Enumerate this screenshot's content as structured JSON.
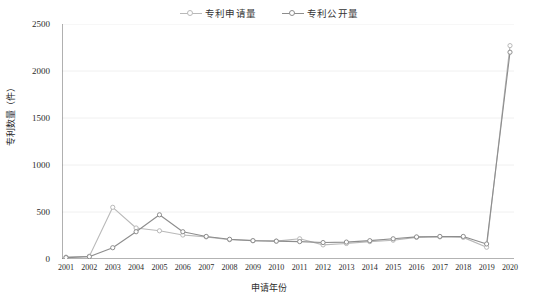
{
  "chart_data": {
    "type": "line",
    "title": "",
    "xlabel": "申请年份",
    "ylabel": "专利数量（件）",
    "ylim": [
      0,
      2500
    ],
    "yticks": [
      0,
      500,
      1000,
      1500,
      2000,
      2500
    ],
    "grid": true,
    "legend_position": "top-center",
    "categories": [
      "2001",
      "2002",
      "2003",
      "2004",
      "2005",
      "2006",
      "2007",
      "2008",
      "2009",
      "2010",
      "2011",
      "2012",
      "2013",
      "2014",
      "2015",
      "2016",
      "2017",
      "2018",
      "2019",
      "2020"
    ],
    "series": [
      {
        "name": "专利申请量",
        "color": "#b9b9b9",
        "marker": "circle-open",
        "values": [
          20,
          30,
          550,
          330,
          300,
          255,
          235,
          205,
          195,
          190,
          215,
          150,
          165,
          185,
          200,
          230,
          235,
          230,
          125,
          2270
        ]
      },
      {
        "name": "专利公开量",
        "color": "#8d8d8d",
        "marker": "circle-open",
        "values": [
          15,
          25,
          120,
          290,
          470,
          290,
          240,
          210,
          195,
          190,
          185,
          175,
          180,
          195,
          215,
          235,
          240,
          240,
          160,
          2200
        ]
      }
    ]
  },
  "axes": {
    "y_unit_label": "专利数量（件）",
    "x_unit_label": "申请年份"
  },
  "colors": {
    "series_1": "#b9b9b9",
    "series_2": "#8d8d8d",
    "axis": "#6e6e6e",
    "grid": "#ececec",
    "text": "#2b2b2b",
    "background": "#ffffff"
  }
}
